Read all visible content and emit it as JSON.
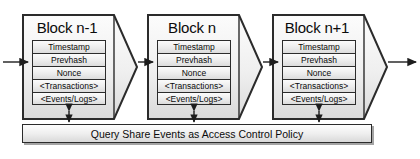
{
  "figure": {
    "type": "diagram",
    "background": "#ffffff",
    "stroke_color": "#2b2b2b",
    "fill_top": "#fbfbfb",
    "fill_bottom": "#d9d9d9"
  },
  "blocks": [
    {
      "title": "Block n-1",
      "fields": [
        "Timestamp",
        "Prevhash",
        "Nonce",
        "<Transactions>",
        "<Events/Logs>"
      ]
    },
    {
      "title": "Block n",
      "fields": [
        "Timestamp",
        "Prevhash",
        "Nonce",
        "<Transactions>",
        "<Events/Logs>"
      ]
    },
    {
      "title": "Block n+1",
      "fields": [
        "Timestamp",
        "Prevhash",
        "Nonce",
        "<Transactions>",
        "<Events/Logs>"
      ]
    }
  ],
  "policy_bar": {
    "label": "Query Share Events as Access Control Policy"
  },
  "caption": {
    "text": ""
  },
  "connectors": {
    "chain_arrow": "arrow-right-icon",
    "policy_link": "double-headed-arrow-vertical-icon"
  }
}
